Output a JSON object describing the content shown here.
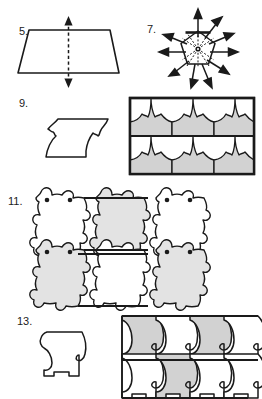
{
  "page": {
    "kind": "worksheet-figures",
    "background_color": "#ffffff",
    "ink_color": "#1a1a1a",
    "shade_color": "#d2d2d2",
    "shade_color_light": "#e3e3e3",
    "width": 262,
    "height": 399
  },
  "exercises": [
    {
      "number": "5.",
      "name": "trapezoid-line-of-symmetry",
      "figure_type": "trapezoid-with-vertical-dashed-symmetry-axis",
      "has_shading": false,
      "arrow_heads": 2,
      "axis_style": "dashed"
    },
    {
      "number": "7.",
      "name": "pentagon-rotational-symmetry",
      "figure_type": "pentagon-with-radiating-arrows",
      "has_shading": false,
      "arrow_count": 10,
      "spoke_style": "dashed",
      "center_dot": true
    },
    {
      "number": "9.",
      "name": "leaf-tile-and-tessellation",
      "figure_type": "tile-plus-tessellation",
      "has_shading": true,
      "tessellation_rows": 2,
      "tessellation_columns": 3,
      "tile_description": "curved-leaf-tile"
    },
    {
      "number": "11.",
      "name": "creature-tessellation",
      "figure_type": "tessellation-only",
      "has_shading": true,
      "tessellation_rows": 2,
      "tessellation_columns": 3,
      "tile_description": "eared-creature-with-two-eye-dots"
    },
    {
      "number": "13.",
      "name": "puzzle-tile-and-tessellation",
      "figure_type": "tile-plus-tessellation",
      "has_shading": true,
      "tessellation_rows": 2,
      "tessellation_columns": 3,
      "tile_description": "hook-notch-puzzle-tile"
    }
  ]
}
